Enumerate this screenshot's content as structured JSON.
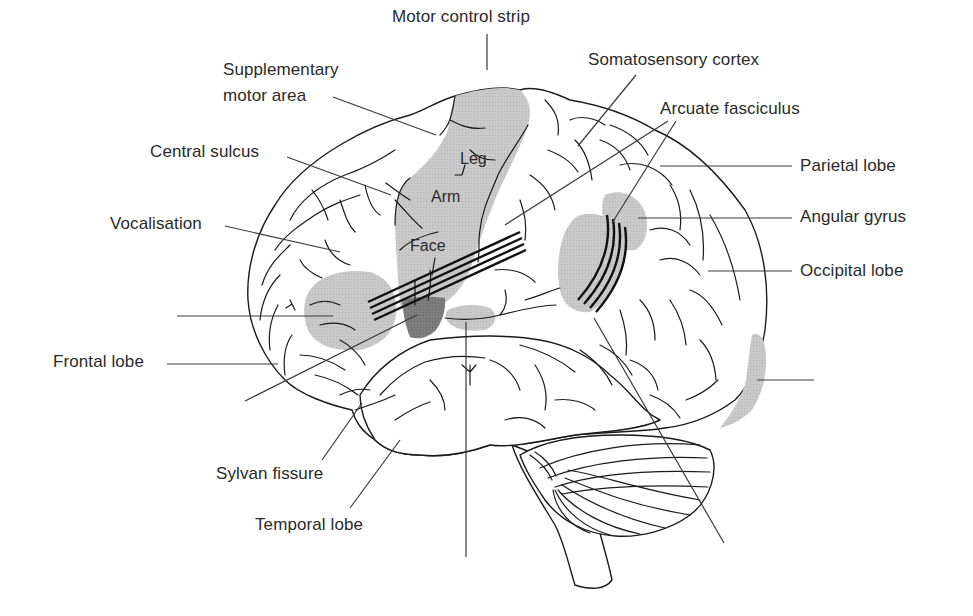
{
  "diagram": {
    "colors": {
      "background": "#ffffff",
      "outline": "#1a1a1a",
      "text": "#2a2a2a",
      "shaded_region": "#c4c4c4",
      "dark_region": "#808080",
      "fibres": "#111111"
    },
    "labels": {
      "motor_control_strip": "Motor control strip",
      "supplementary_motor_area_line1": "Supplementary",
      "supplementary_motor_area_line2": "motor area",
      "central_sulcus": "Central sulcus",
      "vocalisation": "Vocalisation",
      "frontal_lobe": "Frontal lobe",
      "sylvan_fissure": "Sylvan fissure",
      "temporal_lobe": "Temporal lobe",
      "somatosensory_cortex": "Somatosensory cortex",
      "arcuate_fasciculus": "Arcuate fasciculus",
      "parietal_lobe": "Parietal lobe",
      "angular_gyrus": "Angular gyrus",
      "occipital_lobe": "Occipital lobe"
    },
    "motor_strip_regions": {
      "leg": "Leg",
      "arm": "Arm",
      "face": "Face"
    },
    "unlabeled_leader_lines": [
      {
        "position": "left-middle",
        "points_to": "frontal shaded area"
      },
      {
        "position": "lower-left diagonal",
        "points_to": "dark shaded area (Broca's)"
      },
      {
        "position": "bottom-center vertical",
        "points_to": "shaded area on superior temporal gyrus"
      },
      {
        "position": "bottom-right diagonal",
        "points_to": "shaded area near angular gyrus (Wernicke's)"
      },
      {
        "position": "right",
        "points_to": "shaded occipital pole (visual cortex)"
      }
    ]
  }
}
